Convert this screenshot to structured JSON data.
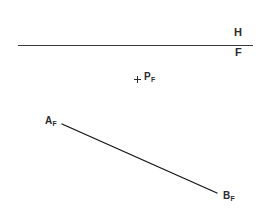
{
  "drawing": {
    "title": "Descriptive geometry frontal view",
    "background_color": "#ffffff",
    "line_color": "#1a1a1a",
    "fold_line_color": "#3a3a3a",
    "text_color": "#2b2b2b",
    "width": 271,
    "height": 216
  },
  "fold_line": {
    "name": "horizontal-frontal fold line",
    "x1": 18,
    "y1": 46,
    "x2": 253,
    "y2": 46,
    "upper_label": "H",
    "lower_label": "F"
  },
  "point_p": {
    "label_letter": "P",
    "label_subscript": "F",
    "mark": "+",
    "mark_x": 137,
    "mark_y": 79
  },
  "segment_ab": {
    "name": "line segment AB frontal view",
    "x1": 62,
    "y1": 124,
    "x2": 217,
    "y2": 193,
    "endpoint_a": {
      "label_letter": "A",
      "label_subscript": "F"
    },
    "endpoint_b": {
      "label_letter": "B",
      "label_subscript": "F"
    }
  }
}
